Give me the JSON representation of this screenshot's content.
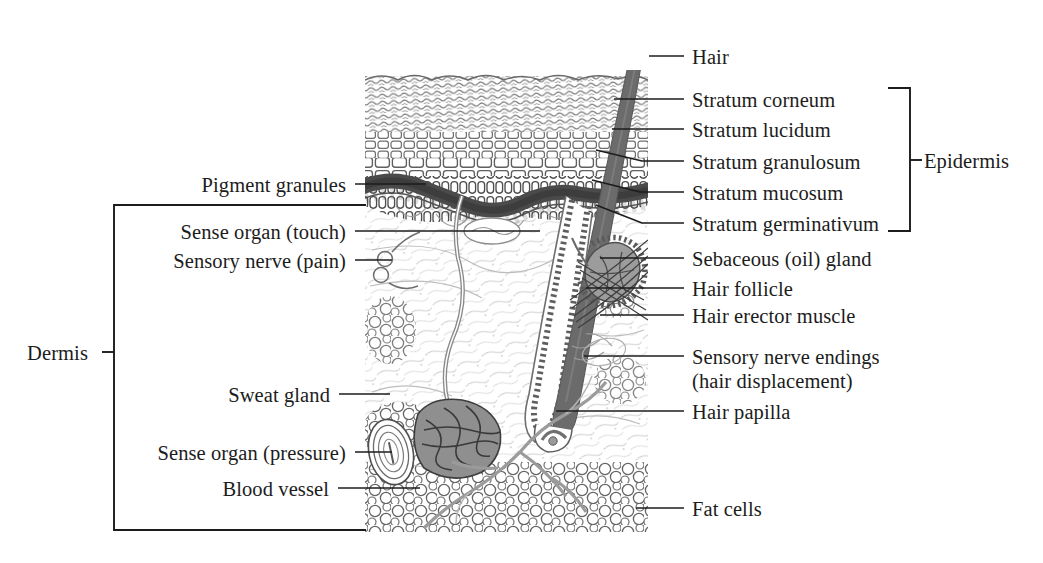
{
  "figure": {
    "type": "anatomical-diagram",
    "background_color": "#ffffff",
    "ink_color": "#1c1c1c",
    "hair_color": "#6b6b6b",
    "pigment_layer_color": "#4a4a4a",
    "gland_color": "#8c8c8c"
  },
  "brackets": {
    "epidermis": {
      "label": "Epidermis"
    },
    "dermis": {
      "label": "Dermis"
    }
  },
  "labels_right": [
    {
      "text": "Hair"
    },
    {
      "text": "Stratum corneum"
    },
    {
      "text": "Stratum lucidum"
    },
    {
      "text": "Stratum granulosum"
    },
    {
      "text": "Stratum mucosum"
    },
    {
      "text": "Stratum germinativum"
    },
    {
      "text": "Sebaceous (oil) gland"
    },
    {
      "text": "Hair follicle"
    },
    {
      "text": "Hair erector muscle"
    },
    {
      "text": "Sensory nerve endings"
    },
    {
      "text": "(hair displacement)"
    },
    {
      "text": "Hair papilla"
    },
    {
      "text": "Fat cells"
    }
  ],
  "labels_left": [
    {
      "text": "Pigment granules"
    },
    {
      "text": "Sense organ (touch)"
    },
    {
      "text": "Sensory nerve (pain)"
    },
    {
      "text": "Sweat gland"
    },
    {
      "text": "Sense organ (pressure)"
    },
    {
      "text": "Blood vessel"
    }
  ]
}
